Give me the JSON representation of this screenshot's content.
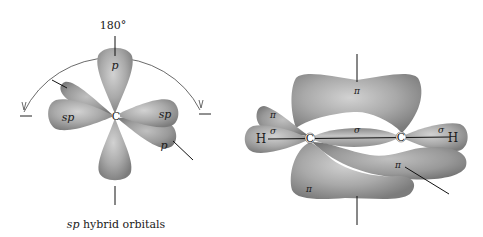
{
  "left_figure": {
    "angle_label": "180°",
    "center_atom": "C",
    "lobes": {
      "p_top": "p",
      "sp_left": "sp",
      "sp_right": "sp",
      "p_right": "p"
    },
    "caption_italic": "sp",
    "caption_rest": " hybrid orbitals"
  },
  "right_figure": {
    "atoms": {
      "h_left": "H",
      "c_left": "C",
      "c_right": "C",
      "h_right": "H"
    },
    "bond_labels": {
      "pi_top": "π",
      "pi_upper_left": "π",
      "sigma_left": "σ",
      "sigma_center": "σ",
      "sigma_right": "σ",
      "pi_lower_right": "π",
      "pi_lower_left": "π"
    }
  },
  "colors": {
    "lobe_light": "#c8c8c8",
    "lobe_mid": "#a6a6a6",
    "lobe_dark": "#7a7a7a",
    "line": "#222222"
  }
}
